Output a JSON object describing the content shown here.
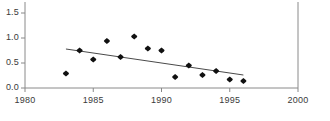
{
  "chart_data": {
    "type": "scatter",
    "title": "",
    "subtitle": "",
    "xlabel": "",
    "ylabel": "",
    "xlim": [
      1980,
      2000
    ],
    "ylim": [
      0.0,
      1.75
    ],
    "grid": false,
    "legend": "none",
    "x_ticks": [
      "1980",
      "1985",
      "1990",
      "1995",
      "2000"
    ],
    "x_tick_values": [
      1980,
      1985,
      1990,
      1995,
      2000
    ],
    "y_ticks": [
      "0.0",
      "0.5",
      "1.0",
      "1.5"
    ],
    "y_tick_values": [
      0.0,
      0.5,
      1.0,
      1.5
    ],
    "marker": "diamond",
    "marker_color": "#111111",
    "line_color": "#4a4a4a",
    "axis_color": "#888888",
    "x": [
      1983,
      1984,
      1985,
      1986,
      1987,
      1988,
      1989,
      1990,
      1991,
      1992,
      1993,
      1994,
      1995,
      1996
    ],
    "values": [
      0.29,
      0.75,
      0.57,
      0.94,
      0.62,
      1.03,
      0.79,
      0.75,
      0.22,
      0.45,
      0.26,
      0.34,
      0.17,
      0.14
    ],
    "points": [
      {
        "x": 1983,
        "y": 0.29
      },
      {
        "x": 1984,
        "y": 0.75
      },
      {
        "x": 1985,
        "y": 0.57
      },
      {
        "x": 1986,
        "y": 0.94
      },
      {
        "x": 1987,
        "y": 0.62
      },
      {
        "x": 1988,
        "y": 1.03
      },
      {
        "x": 1989,
        "y": 0.79
      },
      {
        "x": 1990,
        "y": 0.75
      },
      {
        "x": 1991,
        "y": 0.22
      },
      {
        "x": 1992,
        "y": 0.45
      },
      {
        "x": 1993,
        "y": 0.26
      },
      {
        "x": 1994,
        "y": 0.34
      },
      {
        "x": 1995,
        "y": 0.17
      },
      {
        "x": 1996,
        "y": 0.14
      }
    ],
    "trendline": {
      "x_start": 1983,
      "y_start": 0.78,
      "x_end": 1996,
      "y_end": 0.26
    }
  }
}
